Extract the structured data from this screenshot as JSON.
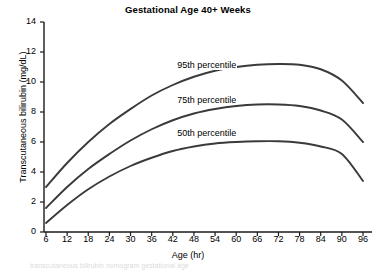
{
  "chart_data": {
    "type": "line",
    "title": "Gestational Age 40+ Weeks",
    "xlabel": "Age (hr)",
    "ylabel": "Transcutaneous bilirubin (mg/dL)",
    "xlim": [
      3,
      99
    ],
    "ylim": [
      0,
      14
    ],
    "xticks": [
      6,
      12,
      18,
      24,
      30,
      36,
      42,
      48,
      54,
      60,
      66,
      72,
      78,
      84,
      90,
      96
    ],
    "yticks": [
      0,
      2,
      4,
      6,
      8,
      10,
      12,
      14
    ],
    "grid": false,
    "legend_position": "inline-annotations",
    "x": [
      6,
      12,
      18,
      24,
      30,
      36,
      42,
      48,
      54,
      60,
      66,
      72,
      78,
      84,
      90,
      96
    ],
    "series": [
      {
        "name": "95th percentile",
        "color": "#3a3a3a",
        "values": [
          3.0,
          4.6,
          6.0,
          7.2,
          8.2,
          9.1,
          9.8,
          10.35,
          10.75,
          11.0,
          11.15,
          11.2,
          11.15,
          10.85,
          10.1,
          8.6
        ],
        "label": "95th percentile",
        "label_x": 43,
        "label_y": 11.1
      },
      {
        "name": "75th percentile",
        "color": "#3a3a3a",
        "values": [
          1.6,
          3.0,
          4.2,
          5.2,
          6.1,
          6.85,
          7.45,
          7.9,
          8.2,
          8.4,
          8.5,
          8.5,
          8.4,
          8.1,
          7.5,
          6.0
        ],
        "label": "75th percentile",
        "label_x": 43,
        "label_y": 8.75
      },
      {
        "name": "50th percentile",
        "color": "#3a3a3a",
        "values": [
          0.6,
          1.8,
          2.85,
          3.7,
          4.4,
          4.95,
          5.4,
          5.7,
          5.9,
          6.0,
          6.05,
          6.05,
          5.95,
          5.7,
          5.2,
          3.4
        ],
        "label": "50th percentile",
        "label_x": 43,
        "label_y": 6.55
      }
    ]
  },
  "axes": {
    "axis_color": "#1a1a1a"
  },
  "footer": {
    "smudge_text": "transcutaneous bilirubin nomogram gestational age"
  }
}
